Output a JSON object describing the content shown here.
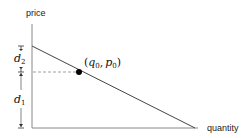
{
  "diagram": {
    "type": "demand-curve",
    "axes": {
      "y_label": "price",
      "x_label": "quantity"
    },
    "point": {
      "label": "(q0, p0)",
      "q_symbol": "q",
      "q_sub": "0",
      "p_symbol": "p",
      "p_sub": "0",
      "separator": ",",
      "open_paren": "(",
      "close_paren": ")"
    },
    "dimensions": [
      {
        "symbol": "d",
        "sub": "2",
        "label": "d2",
        "meaning": "from point price to intercept"
      },
      {
        "symbol": "d",
        "sub": "1",
        "label": "d1",
        "meaning": "from axis to point price"
      }
    ],
    "colors": {
      "line": "#444444",
      "axis": "#888888",
      "dashed": "#888888",
      "point": "#000000"
    }
  }
}
